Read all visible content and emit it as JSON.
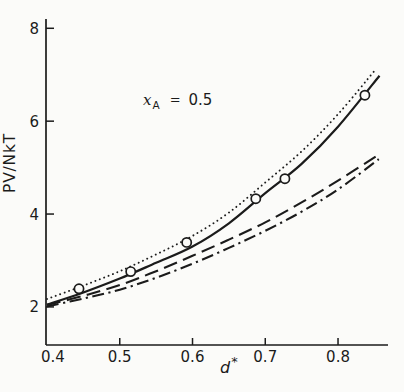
{
  "figure": {
    "background": "#fbfbf9",
    "ink_color": "#1b1b1b"
  },
  "chart_data": {
    "type": "line",
    "title": "",
    "xlabel": "d*",
    "xlabel_base": "d",
    "xlabel_sup": "*",
    "ylabel": "PV/NkT",
    "annotation": {
      "variable": "x",
      "subscript": "A",
      "relation": "=",
      "value": "0.5"
    },
    "xlim": [
      0.4,
      0.868
    ],
    "ylim": [
      1.18,
      8.2
    ],
    "grid": false,
    "legend": "none",
    "xticks": [
      {
        "value": 0.4,
        "label": "0.4"
      },
      {
        "value": 0.5,
        "label": "0.5"
      },
      {
        "value": 0.6,
        "label": "0.6"
      },
      {
        "value": 0.7,
        "label": "0.7"
      },
      {
        "value": 0.8,
        "label": "0.8"
      }
    ],
    "yticks": [
      {
        "value": 2,
        "label": "2"
      },
      {
        "value": 4,
        "label": "4"
      },
      {
        "value": 6,
        "label": "6"
      },
      {
        "value": 8,
        "label": "8"
      }
    ],
    "series": [
      {
        "name": "dash-dot-curve",
        "line_style": "dash-dot",
        "x": [
          0.4,
          0.45,
          0.5,
          0.55,
          0.6,
          0.65,
          0.7,
          0.75,
          0.8,
          0.856
        ],
        "y": [
          2.01,
          2.18,
          2.37,
          2.63,
          2.93,
          3.27,
          3.64,
          4.05,
          4.53,
          5.18
        ]
      },
      {
        "name": "long-dash-curve",
        "line_style": "long-dash",
        "x": [
          0.4,
          0.45,
          0.5,
          0.55,
          0.6,
          0.65,
          0.7,
          0.75,
          0.8,
          0.856
        ],
        "y": [
          2.04,
          2.24,
          2.47,
          2.77,
          3.1,
          3.45,
          3.82,
          4.25,
          4.72,
          5.28
        ]
      },
      {
        "name": "dotted-curve",
        "line_style": "dotted",
        "x": [
          0.4,
          0.45,
          0.5,
          0.55,
          0.6,
          0.65,
          0.7,
          0.75,
          0.8,
          0.851
        ],
        "y": [
          2.17,
          2.46,
          2.77,
          3.13,
          3.53,
          4.03,
          4.68,
          5.35,
          6.15,
          7.1
        ]
      },
      {
        "name": "solid-curve",
        "line_style": "solid",
        "x": [
          0.4,
          0.45,
          0.5,
          0.55,
          0.6,
          0.65,
          0.7,
          0.75,
          0.8,
          0.857
        ],
        "y": [
          2.05,
          2.31,
          2.61,
          2.95,
          3.3,
          3.8,
          4.45,
          5.08,
          5.88,
          6.98
        ]
      }
    ],
    "markers": {
      "name": "data-points",
      "symbol": "open-circle",
      "x": [
        0.444,
        0.515,
        0.592,
        0.687,
        0.727,
        0.837
      ],
      "y": [
        2.39,
        2.76,
        3.39,
        4.33,
        4.76,
        6.56
      ]
    }
  }
}
